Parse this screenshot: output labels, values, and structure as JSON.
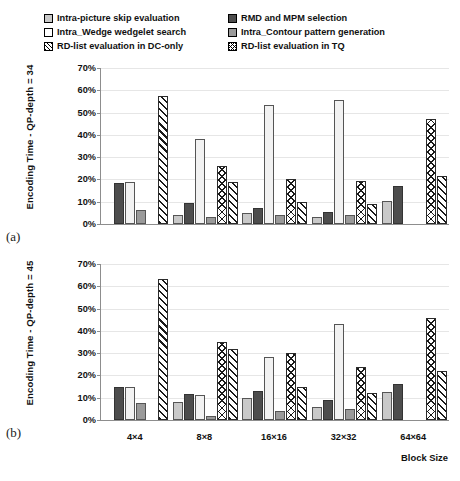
{
  "legend": {
    "items": [
      {
        "label": "Intra-picture skip evaluation",
        "swatch": "light-gray-square-icon",
        "style": "sw-lightgray",
        "col": 1
      },
      {
        "label": "RMD and MPM selection",
        "swatch": "dark-gray-square-icon",
        "style": "sw-darkgray",
        "col": 2
      },
      {
        "label": "Intra_Wedge wedgelet search",
        "swatch": "white-square-icon",
        "style": "sw-white",
        "col": 1
      },
      {
        "label": "Intra_Contour pattern generation",
        "swatch": "mid-gray-square-icon",
        "style": "sw-midgray",
        "col": 2
      },
      {
        "label": "RD-list evaluation in DC-only",
        "swatch": "diagonal-hatch-square-icon",
        "style": "sw-diag",
        "col": 1
      },
      {
        "label": "RD-list evaluation in TQ",
        "swatch": "cross-hatch-square-icon",
        "style": "sw-cross",
        "col": 2
      }
    ]
  },
  "panel_a": {
    "tag": "(a)",
    "ylabel": "Encoding  Time - QP-depth = 34"
  },
  "panel_b": {
    "tag": "(b)",
    "ylabel": "Encoding  Time - QP-depth = 45"
  },
  "xtitle": "Block Size",
  "yticks": [
    "0%",
    "10%",
    "20%",
    "30%",
    "40%",
    "50%",
    "60%",
    "70%"
  ],
  "chart_data": [
    {
      "type": "bar",
      "id": "panel-a",
      "title": "(a)",
      "xlabel": "Block Size",
      "ylabel": "Encoding  Time - QP-depth = 34",
      "ylim": [
        0,
        70
      ],
      "yunit": "%",
      "yticks": [
        0,
        10,
        20,
        30,
        40,
        50,
        60,
        70
      ],
      "grid": true,
      "legend_position": "top",
      "categories": [
        "4×4",
        "8×8",
        "16×16",
        "32×32",
        "64×64"
      ],
      "series": [
        {
          "name": "Intra-picture skip evaluation",
          "style": "b-lightgray",
          "values": [
            null,
            4.2,
            5.0,
            3.2,
            10.5
          ]
        },
        {
          "name": "RMD and MPM selection",
          "style": "b-darkgray",
          "values": [
            18.2,
            9.5,
            7.0,
            5.5,
            17.0
          ]
        },
        {
          "name": "Intra_Wedge wedgelet search",
          "style": "b-white",
          "values": [
            18.7,
            38.0,
            53.5,
            55.5,
            null
          ]
        },
        {
          "name": "Intra_Contour pattern generation",
          "style": "b-midgray",
          "values": [
            6.2,
            3.0,
            4.0,
            4.0,
            null
          ]
        },
        {
          "name": "RD-list evaluation in DC-only",
          "style": "b-cross",
          "values": [
            null,
            26.0,
            20.0,
            19.2,
            47.0
          ]
        },
        {
          "name": "RD-list evaluation in TQ",
          "style": "b-diag",
          "values": [
            57.5,
            19.0,
            10.0,
            9.2,
            21.5
          ]
        }
      ]
    },
    {
      "type": "bar",
      "id": "panel-b",
      "title": "(b)",
      "xlabel": "Block Size",
      "ylabel": "Encoding  Time - QP-depth = 45",
      "ylim": [
        0,
        70
      ],
      "yunit": "%",
      "yticks": [
        0,
        10,
        20,
        30,
        40,
        50,
        60,
        70
      ],
      "grid": true,
      "legend_position": "top",
      "categories": [
        "4×4",
        "8×8",
        "16×16",
        "32×32",
        "64×64"
      ],
      "series": [
        {
          "name": "Intra-picture skip evaluation",
          "style": "b-lightgray",
          "values": [
            null,
            8.3,
            10.0,
            6.0,
            12.5
          ]
        },
        {
          "name": "RMD and MPM selection",
          "style": "b-darkgray",
          "values": [
            14.7,
            11.8,
            13.0,
            9.0,
            16.3
          ]
        },
        {
          "name": "Intra_Wedge wedgelet search",
          "style": "b-white",
          "values": [
            14.7,
            11.2,
            28.5,
            43.0,
            null
          ]
        },
        {
          "name": "Intra_Contour pattern generation",
          "style": "b-midgray",
          "values": [
            7.5,
            1.8,
            4.0,
            5.0,
            null
          ]
        },
        {
          "name": "RD-list evaluation in DC-only",
          "style": "b-cross",
          "values": [
            null,
            34.8,
            30.0,
            24.0,
            46.0
          ]
        },
        {
          "name": "RD-list evaluation in TQ",
          "style": "b-diag",
          "values": [
            63.5,
            32.0,
            15.0,
            12.0,
            22.0
          ]
        }
      ]
    }
  ]
}
